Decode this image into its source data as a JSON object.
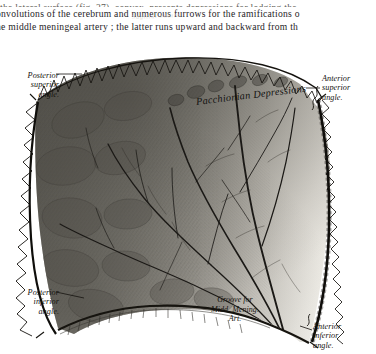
{
  "page": {
    "background_color": "#ffffff",
    "ink_color": "#1a1a1a"
  },
  "body_text": {
    "line_clipped_top": "the lateral surface (fig. 27), convex, presents depressions for lodging the",
    "line1": "onvolutions of the cerebrum and numerous furrows for the ramifications o",
    "line2": "he middle meningeal artery ;  the latter runs upward and backward from th"
  },
  "figure": {
    "suture_label": "Sagittal Suture",
    "labels": {
      "posterior_superior_angle": "Posterior\nsuperior\nangle.",
      "anterior_superior_angle": "Anterior\nsuperior\nangle.",
      "posterior_inferior_angle": "Posterior\ninferior\nangle.",
      "anterior_inferior_angle": "Anterior\ninferior\nangle.",
      "pacchionian_depressions": "Pacchionian  Depressions",
      "groove_for_middle_meningeal_artery": "Groove for\nMidd. Mening.\nArt."
    },
    "caption": "Fig. 27.—Left Parietal Bone. Outer Surface."
  },
  "colors": {
    "bone_dark": "#55534d",
    "bone_mid": "#8b8981",
    "bone_light": "#cfccc4",
    "bone_pale": "#f2f0ea",
    "groove_line": "#1d1b17",
    "suture_ink": "#17150f"
  }
}
